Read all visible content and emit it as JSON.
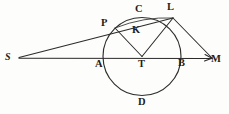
{
  "figure": {
    "width": 229,
    "height": 114,
    "background_color": "#fdfdfb",
    "ink_color": "#2b2b2b"
  },
  "labels": {
    "s": "S",
    "p": "P",
    "c": "C",
    "l": "L",
    "k": "K",
    "a": "A",
    "t": "T",
    "b": "B",
    "m": "M",
    "d": "D"
  },
  "geometry": {
    "circle": {
      "center_x": 142,
      "center_y": 56.5,
      "radius": 39
    },
    "points": {
      "S": {
        "x": 19,
        "y": 58
      },
      "P": {
        "x": 115,
        "y": 28
      },
      "C": {
        "x": 142,
        "y": 17.5
      },
      "L": {
        "x": 173,
        "y": 18
      },
      "K": {
        "x": 137,
        "y": 31
      },
      "A": {
        "x": 103,
        "y": 56.5
      },
      "T": {
        "x": 142,
        "y": 56.5
      },
      "B": {
        "x": 181,
        "y": 56.5
      },
      "M": {
        "x": 212,
        "y": 58
      },
      "D": {
        "x": 142,
        "y": 95.5
      }
    },
    "segments": [
      {
        "name": "S-M baseline",
        "from": "S",
        "to": "M"
      },
      {
        "name": "S-L secant through P",
        "from": "S",
        "to": "L"
      },
      {
        "name": "L-M chord extension",
        "from": "L",
        "to": "M"
      },
      {
        "name": "P-T radius",
        "from": "P",
        "to": "T"
      },
      {
        "name": "T-L radius",
        "from": "T",
        "to": "L"
      },
      {
        "name": "P-L chord",
        "from": "P",
        "to": "L"
      }
    ]
  },
  "label_positions": {
    "S": {
      "left": 5,
      "top": 52
    },
    "P": {
      "left": 101,
      "top": 18
    },
    "C": {
      "left": 135,
      "top": 4
    },
    "L": {
      "left": 167,
      "top": 2
    },
    "K": {
      "left": 132,
      "top": 25
    },
    "A": {
      "left": 95,
      "top": 59
    },
    "T": {
      "left": 138,
      "top": 59
    },
    "B": {
      "left": 178,
      "top": 58
    },
    "M": {
      "left": 211,
      "top": 54
    },
    "D": {
      "left": 138,
      "top": 97
    }
  }
}
